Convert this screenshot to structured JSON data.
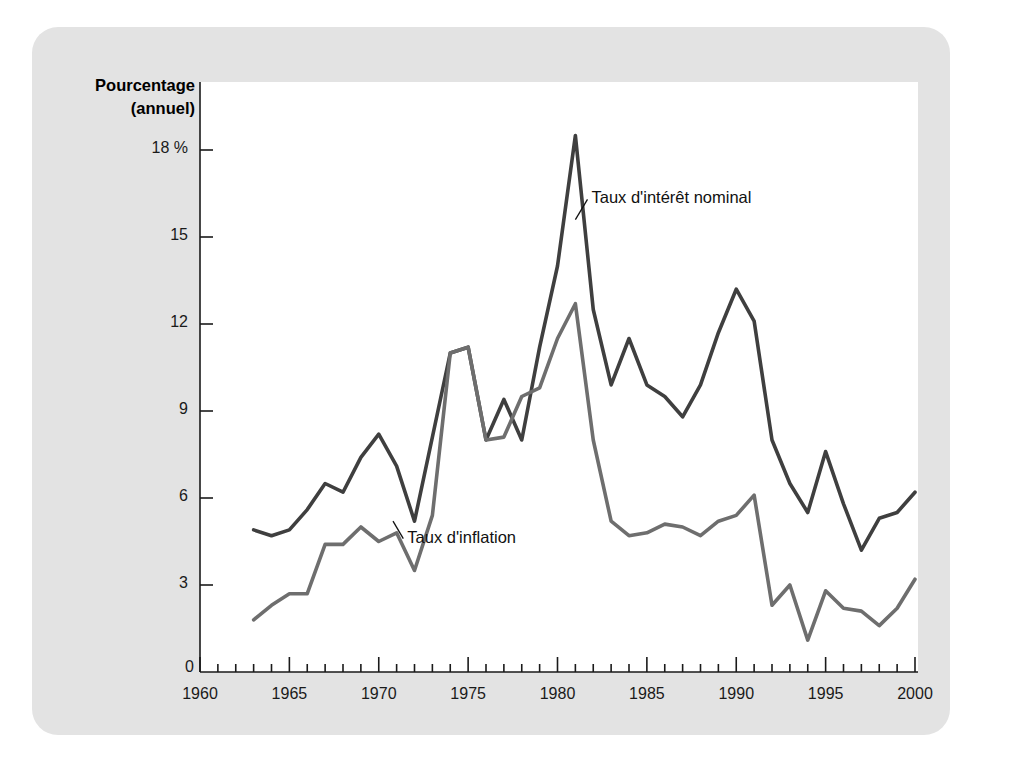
{
  "figure": {
    "background_color": "#e3e3e3",
    "plot_background_color": "#ffffff",
    "axis_title_line1": "Pourcentage",
    "axis_title_line2": "(annuel)"
  },
  "chart_data": {
    "type": "line",
    "title": "",
    "xlabel": "",
    "ylabel": "Pourcentage (annuel)",
    "xlim": [
      1960,
      2000
    ],
    "ylim": [
      0,
      19.5
    ],
    "xticks": [
      1960,
      1965,
      1970,
      1975,
      1980,
      1985,
      1990,
      1995,
      2000
    ],
    "xtick_labels": [
      "1960",
      "1965",
      "1970",
      "1975",
      "1980",
      "1985",
      "1990",
      "1995",
      "2000"
    ],
    "xminor_step": 1,
    "yticks": [
      0,
      3,
      6,
      9,
      12,
      15,
      18
    ],
    "ytick_labels": [
      "0",
      "3",
      "6",
      "9",
      "12",
      "15",
      "18 %"
    ],
    "grid": false,
    "legend_position": "inline-annotations",
    "series": [
      {
        "name": "Taux d'intérêt nominal",
        "color": "#3f3f3f",
        "width": 3.6,
        "label_x": 1981.9,
        "label_y": 16.3,
        "leader_from_x": 1981.0,
        "leader_from_y": 15.6,
        "x": [
          1963,
          1964,
          1965,
          1966,
          1967,
          1968,
          1969,
          1970,
          1971,
          1972,
          1973,
          1974,
          1975,
          1976,
          1977,
          1978,
          1979,
          1980,
          1981,
          1982,
          1983,
          1984,
          1985,
          1986,
          1987,
          1988,
          1989,
          1990,
          1991,
          1992,
          1993,
          1994,
          1995,
          1996,
          1997,
          1998,
          1999,
          2000
        ],
        "values": [
          4.9,
          4.7,
          4.9,
          5.6,
          6.5,
          6.2,
          7.4,
          8.2,
          7.1,
          5.2,
          8.1,
          11.0,
          11.2,
          8.0,
          9.4,
          8.0,
          11.2,
          14.0,
          18.5,
          12.5,
          9.9,
          11.5,
          9.9,
          9.5,
          8.8,
          9.9,
          11.7,
          13.2,
          12.1,
          8.0,
          6.5,
          5.5,
          7.6,
          5.8,
          4.2,
          5.3,
          5.5,
          6.2
        ]
      },
      {
        "name": "Taux d'inflation",
        "color": "#6e6e6e",
        "width": 3.6,
        "label_x": 1971.6,
        "label_y": 4.6,
        "leader_from_x": 1970.8,
        "leader_from_y": 5.2,
        "x": [
          1963,
          1964,
          1965,
          1966,
          1967,
          1968,
          1969,
          1970,
          1971,
          1972,
          1973,
          1974,
          1975,
          1976,
          1977,
          1978,
          1979,
          1980,
          1981,
          1982,
          1983,
          1984,
          1985,
          1986,
          1987,
          1988,
          1989,
          1990,
          1991,
          1992,
          1993,
          1994,
          1995,
          1996,
          1997,
          1998,
          1999,
          2000
        ],
        "values": [
          1.8,
          2.3,
          2.7,
          2.7,
          4.4,
          4.4,
          5.0,
          4.5,
          4.8,
          3.5,
          5.4,
          11.0,
          11.2,
          8.0,
          8.1,
          9.5,
          9.8,
          11.5,
          12.7,
          8.0,
          5.2,
          4.7,
          4.8,
          5.1,
          5.0,
          4.7,
          5.2,
          5.4,
          6.1,
          2.3,
          3.0,
          1.1,
          2.8,
          2.2,
          2.1,
          1.6,
          2.2,
          3.2
        ]
      }
    ]
  }
}
